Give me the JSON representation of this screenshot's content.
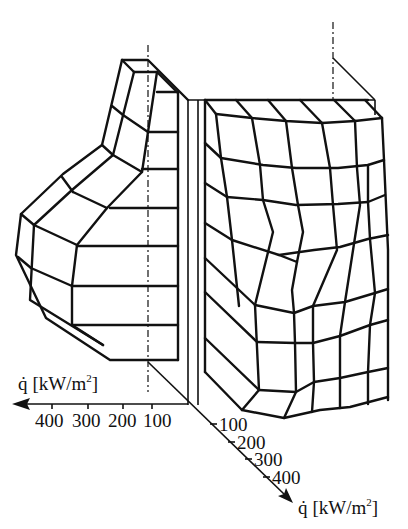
{
  "figure": {
    "type": "3D heat flux distribution diagram (two half-views)",
    "left_axis": {
      "label_symbol": "q̇",
      "label_unit": "[kW/m",
      "label_sup": "2",
      "label_close": "]",
      "ticks": [
        "400",
        "300",
        "200",
        "100"
      ],
      "direction": "left"
    },
    "right_axis": {
      "label_symbol": "q̇",
      "label_unit": "[kW/m",
      "label_sup": "2",
      "label_close": "]",
      "ticks": [
        "100",
        "200",
        "300",
        "400"
      ],
      "direction": "down-right"
    }
  }
}
